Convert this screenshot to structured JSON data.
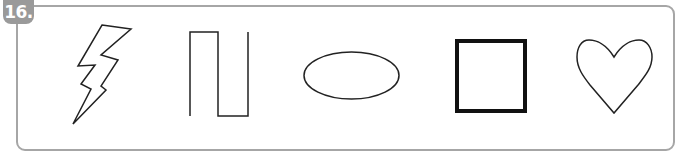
{
  "exercise": {
    "number_label": "16.",
    "badge_color": "#9a9a9a",
    "frame_color": "#a6a6a6"
  },
  "shapes": [
    {
      "name": "lightning-bolt",
      "type": "polygon",
      "stroke_width": 1.5
    },
    {
      "name": "square-wave-line",
      "type": "polyline",
      "stroke_width": 1.5
    },
    {
      "name": "ellipse",
      "type": "ellipse",
      "stroke_width": 1.5
    },
    {
      "name": "square",
      "type": "rect",
      "stroke_width": 4
    },
    {
      "name": "heart",
      "type": "path",
      "stroke_width": 1.5
    }
  ]
}
